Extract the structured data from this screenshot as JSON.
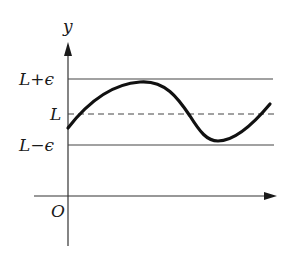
{
  "diagram": {
    "labels": {
      "y_axis": "y",
      "origin": "O",
      "upper_bound": "L+ϵ",
      "limit": "L",
      "lower_bound": "L−ϵ"
    },
    "colors": {
      "ink": "#1a1a1a",
      "background": "#ffffff"
    },
    "geometry": {
      "y_axis_x": 68,
      "x_axis_y": 196,
      "upper_y": 79,
      "limit_y": 114,
      "lower_y": 145,
      "curve_points": [
        [
          68,
          128
        ],
        [
          100,
          96
        ],
        [
          140,
          82
        ],
        [
          175,
          98
        ],
        [
          200,
          132
        ],
        [
          216,
          141
        ],
        [
          245,
          128
        ],
        [
          270,
          104
        ]
      ]
    }
  }
}
